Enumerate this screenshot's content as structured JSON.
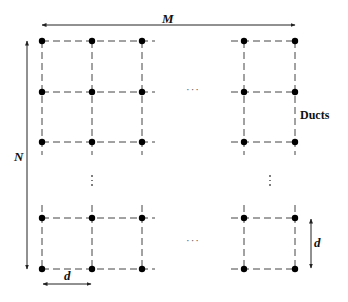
{
  "diagram": {
    "labels": {
      "width": "M",
      "height": "N",
      "spacing_horizontal": "d",
      "spacing_vertical": "d",
      "element": "Ducts"
    },
    "ellipsis_horizontal": "···",
    "grid": {
      "columns_x": [
        42,
        92,
        142,
        244,
        295
      ],
      "rows_y": [
        41,
        92,
        142,
        218,
        269
      ],
      "node_color": "#000000",
      "line_color": "#444444"
    }
  }
}
